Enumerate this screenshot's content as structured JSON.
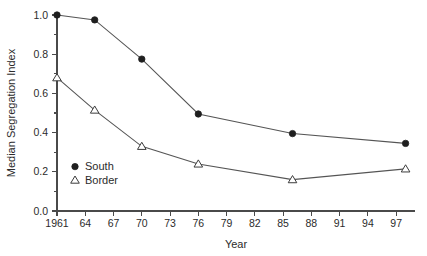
{
  "chart_data": {
    "type": "line",
    "title": "",
    "xlabel": "Year",
    "ylabel": "Median Segregation Index",
    "xlim": [
      1961,
      1999
    ],
    "ylim": [
      0.0,
      1.0
    ],
    "grid": false,
    "legend_position": "inside-lower-left",
    "x_ticks": [
      {
        "value": 1961,
        "label": "1961"
      },
      {
        "value": 1964,
        "label": "64"
      },
      {
        "value": 1967,
        "label": "67"
      },
      {
        "value": 1970,
        "label": "70"
      },
      {
        "value": 1973,
        "label": "73"
      },
      {
        "value": 1976,
        "label": "76"
      },
      {
        "value": 1979,
        "label": "79"
      },
      {
        "value": 1982,
        "label": "82"
      },
      {
        "value": 1985,
        "label": "85"
      },
      {
        "value": 1988,
        "label": "88"
      },
      {
        "value": 1991,
        "label": "91"
      },
      {
        "value": 1994,
        "label": "94"
      },
      {
        "value": 1997,
        "label": "97"
      }
    ],
    "y_ticks": [
      {
        "value": 0.0,
        "label": "0.0",
        "major": true
      },
      {
        "value": 0.1,
        "label": "",
        "major": false
      },
      {
        "value": 0.2,
        "label": "0.2",
        "major": true
      },
      {
        "value": 0.3,
        "label": "",
        "major": false
      },
      {
        "value": 0.4,
        "label": "0.4",
        "major": true
      },
      {
        "value": 0.5,
        "label": "",
        "major": false
      },
      {
        "value": 0.6,
        "label": "0.6",
        "major": true
      },
      {
        "value": 0.7,
        "label": "",
        "major": false
      },
      {
        "value": 0.8,
        "label": "0.8",
        "major": true
      },
      {
        "value": 0.9,
        "label": "",
        "major": false
      },
      {
        "value": 1.0,
        "label": "1.0",
        "major": true
      }
    ],
    "x": [
      1961,
      1965,
      1970,
      1976,
      1986,
      1998
    ],
    "series": [
      {
        "name": "South",
        "marker": "filled-circle",
        "color": "#1f1f1f",
        "values": [
          1.0,
          0.975,
          0.775,
          0.495,
          0.395,
          0.345
        ]
      },
      {
        "name": "Border",
        "marker": "open-triangle",
        "color": "#3c3c3c",
        "values": [
          0.68,
          0.515,
          0.33,
          0.24,
          0.16,
          0.215
        ]
      }
    ]
  },
  "legend": {
    "entries": [
      {
        "label": "South",
        "marker": "filled-circle"
      },
      {
        "label": "Border",
        "marker": "open-triangle"
      }
    ]
  }
}
